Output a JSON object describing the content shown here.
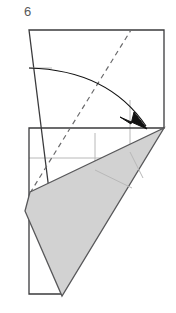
{
  "figure": {
    "step_number": "6",
    "type": "origami-folding-diagram",
    "canvas": {
      "width": 176,
      "height": 313
    }
  },
  "colors": {
    "outline": "#3b3b3d",
    "fold_shape_fill": "#d2d2d2",
    "fold_shape_stroke": "#58585a",
    "crease_light": "#b8b8b8",
    "dashed_line": "#6a6a6c",
    "arrow": "#111111",
    "label_text": "#58585a",
    "background": "#ffffff"
  },
  "geometry": {
    "paper_outline": {
      "name": "paper-sheet",
      "points": "29,30 164,30 164,128 29,128 29,294 62,294"
    },
    "paper_top_box": {
      "name": "paper-top-box",
      "points": "29,30 164,30 164,128"
    },
    "paper_left_edge": {
      "x1": 29,
      "y1": 30,
      "x2": 29,
      "y2": 294
    },
    "paper_top_edge": {
      "x1": 29,
      "y1": 30,
      "x2": 164,
      "y2": 30
    },
    "paper_right_edge": {
      "x1": 164,
      "y1": 30,
      "x2": 164,
      "y2": 128
    },
    "paper_bottom_edge": {
      "x1": 29,
      "y1": 294,
      "x2": 62,
      "y2": 294
    },
    "crease_horizontal_upper": {
      "x1": 29,
      "y1": 68,
      "x2": 52,
      "y2": 68
    },
    "crease_horizontal_mid": {
      "x1": 29,
      "y1": 158,
      "x2": 110,
      "y2": 158
    },
    "crease_vertical_short": {
      "x1": 95,
      "y1": 133,
      "x2": 95,
      "y2": 170
    },
    "crease_vertical_tall": {
      "x1": 130,
      "y1": 100,
      "x2": 130,
      "y2": 152
    },
    "crease_inner_a": {
      "x1": 130,
      "y1": 152,
      "x2": 143,
      "y2": 178
    },
    "crease_inner_b": {
      "x1": 95,
      "y1": 170,
      "x2": 132,
      "y2": 188
    },
    "dashed_fold_line": {
      "x1": 30,
      "y1": 193,
      "x2": 131,
      "y2": 30
    },
    "rotation_arc": {
      "start": {
        "x": 29,
        "y": 68
      },
      "end": {
        "x": 146,
        "y": 126
      },
      "control": {
        "x": 108,
        "y": 70
      }
    },
    "arrow_head": {
      "points": "147,129 134,112 131,124 120,117"
    },
    "folded_flap": {
      "name": "folded-flap",
      "points": "30,192 164,128 62,296 25,211"
    }
  },
  "labels": {
    "step_label_name": "step-number-label"
  }
}
